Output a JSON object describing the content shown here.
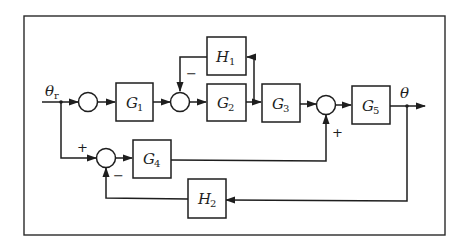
{
  "diagram": {
    "type": "block-diagram",
    "signals": {
      "input": {
        "symbol": "θ",
        "subscript": "r"
      },
      "output": {
        "symbol": "θ"
      }
    },
    "blocks": [
      {
        "id": "G1",
        "symbol": "G",
        "subscript": "1"
      },
      {
        "id": "G2",
        "symbol": "G",
        "subscript": "2"
      },
      {
        "id": "G3",
        "symbol": "G",
        "subscript": "3"
      },
      {
        "id": "G4",
        "symbol": "G",
        "subscript": "4"
      },
      {
        "id": "G5",
        "symbol": "G",
        "subscript": "5"
      },
      {
        "id": "H1",
        "symbol": "H",
        "subscript": "1"
      },
      {
        "id": "H2",
        "symbol": "H",
        "subscript": "2"
      }
    ],
    "summing_junctions": [
      {
        "id": "S1",
        "signs": []
      },
      {
        "id": "S2",
        "signs": [
          "−"
        ]
      },
      {
        "id": "S3",
        "signs": [
          "+"
        ]
      },
      {
        "id": "S4",
        "signs": [
          "+",
          "−"
        ]
      }
    ],
    "signs": {
      "s2_minus": "−",
      "s3_plus": "+",
      "s4_plus": "+",
      "s4_minus": "−"
    },
    "connections": [
      "θr → S1",
      "S1 → G1",
      "G1 → S2",
      "S2 → G2",
      "G2 → G3",
      "G2 output → H1 → S2 (−)",
      "G3 → S3",
      "S3 → G5",
      "G5 → θ",
      "θr → S4 (+)",
      "S4 → G4",
      "G4 → S3 (+)",
      "θ → H2 → S4 (−)"
    ]
  }
}
